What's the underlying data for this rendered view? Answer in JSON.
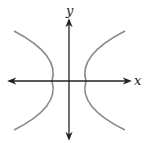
{
  "diagram": {
    "type": "hyperbola-graph",
    "axes": {
      "x_label": "x",
      "y_label": "y"
    },
    "curve": {
      "name": "hyperbola",
      "orientation": "horizontal-transverse-axis",
      "branches": [
        "left",
        "right"
      ],
      "color": "#8a8a8a"
    },
    "axis_color": "#222222"
  }
}
